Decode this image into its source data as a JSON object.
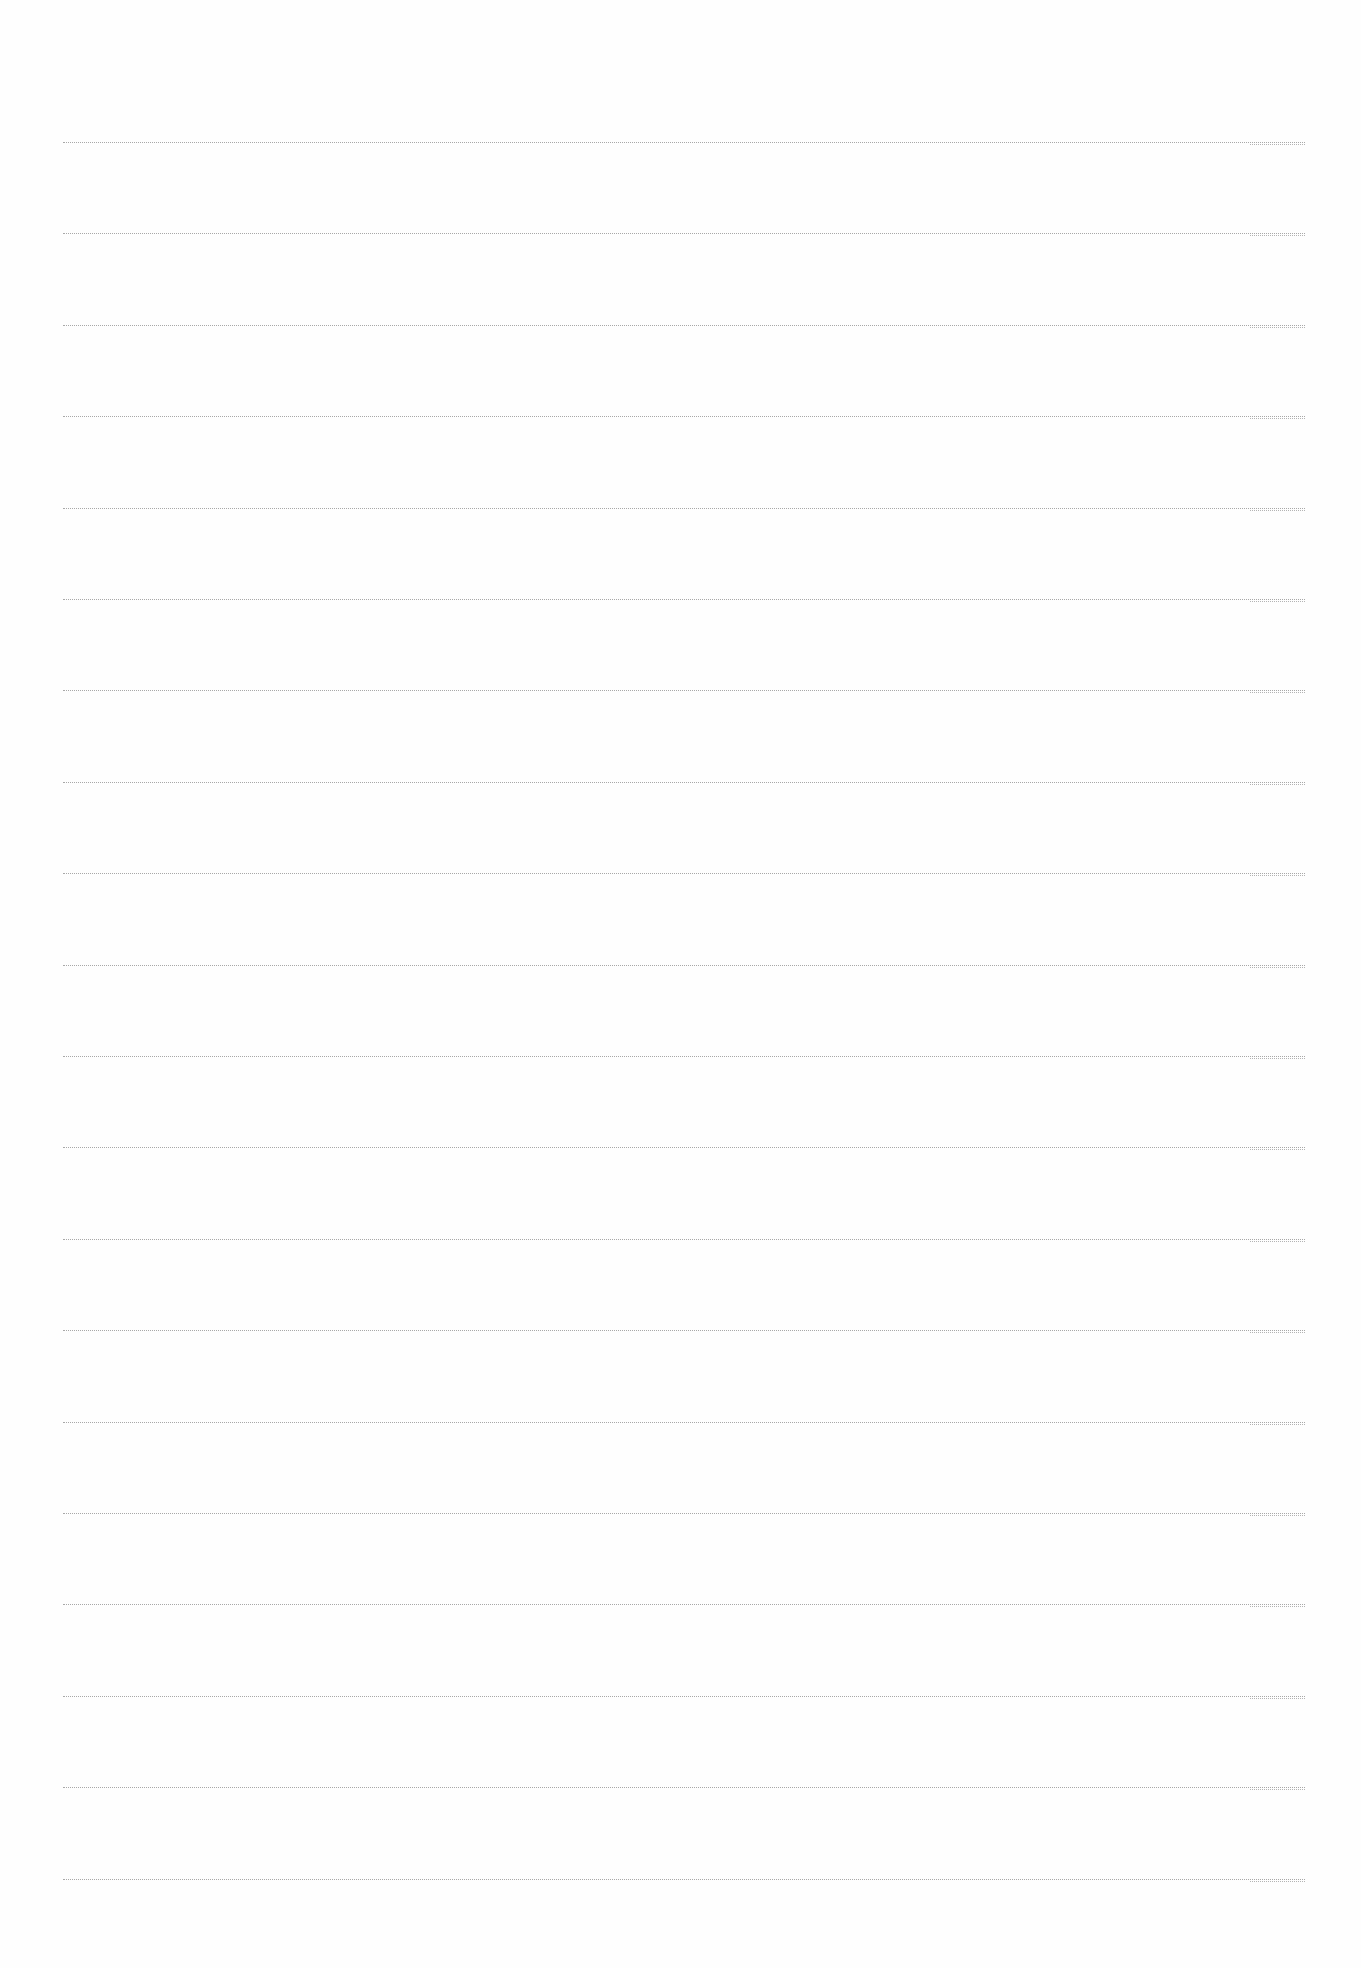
{
  "document": {
    "type": "ruled-paper",
    "background": "#fefefe",
    "rule_color": "#9a9a9a",
    "rule_count": 20,
    "rule_start_y": 142,
    "rule_spacing": 91.4,
    "rule_left": 63,
    "rule_width": 1242,
    "text": ""
  }
}
